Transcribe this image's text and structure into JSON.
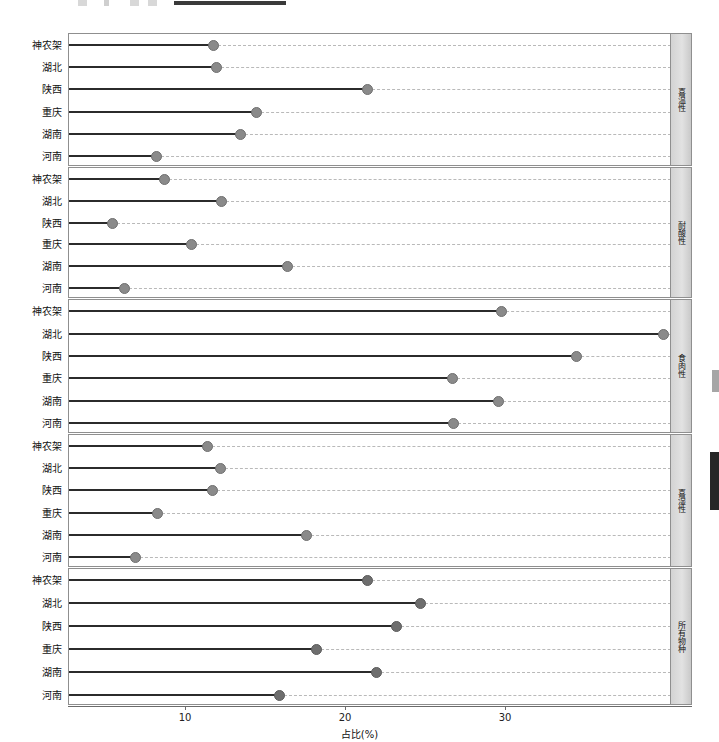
{
  "chart": {
    "type": "faceted-lollipop",
    "x_axis": {
      "title": "占比(%)",
      "ticks": [
        10,
        20,
        30
      ],
      "min": 4.0,
      "max": 43.0
    },
    "categories": [
      "神农架",
      "湖北",
      "陕西",
      "重庆",
      "湖南",
      "河南"
    ],
    "panels": [
      {
        "label": "喜温性",
        "values": [
          11.7,
          11.9,
          21.3,
          14.4,
          13.4,
          8.1
        ]
      },
      {
        "label": "耐酸性",
        "values": [
          8.6,
          12.2,
          5.4,
          10.3,
          16.3,
          6.1
        ]
      },
      {
        "label": "食肉性",
        "values": [
          29.7,
          39.8,
          34.4,
          26.6,
          29.5,
          26.7
        ]
      },
      {
        "label": "喜湿性",
        "values": [
          11.3,
          12.1,
          11.6,
          8.2,
          17.5,
          6.8
        ]
      },
      {
        "label": "所有物种",
        "values": [
          21.3,
          24.6,
          23.1,
          18.1,
          21.9,
          15.8
        ]
      }
    ]
  },
  "chart_data": {
    "type": "scatter",
    "title": "",
    "subtitle": "",
    "xlabel": "占比(%)",
    "ylabel": "",
    "xlim": [
      4.0,
      43.0
    ],
    "xticks": [
      10,
      20,
      30
    ],
    "grid": "horizontal-dashed",
    "legend": "none",
    "facet_labels": [
      "喜温性",
      "耐酸性",
      "食肉性",
      "喜湿性",
      "所有物种"
    ],
    "categories": [
      "神农架",
      "湖北",
      "陕西",
      "重庆",
      "湖南",
      "河南"
    ],
    "series": [
      {
        "name": "喜温性",
        "values": [
          11.7,
          11.9,
          21.3,
          14.4,
          13.4,
          8.1
        ]
      },
      {
        "name": "耐酸性",
        "values": [
          8.6,
          12.2,
          5.4,
          10.3,
          16.3,
          6.1
        ]
      },
      {
        "name": "食肉性",
        "values": [
          29.7,
          39.8,
          34.4,
          26.6,
          29.5,
          26.7
        ]
      },
      {
        "name": "喜湿性",
        "values": [
          11.3,
          12.1,
          11.6,
          8.2,
          17.5,
          6.8
        ]
      },
      {
        "name": "所有物种",
        "values": [
          21.3,
          24.6,
          23.1,
          18.1,
          21.9,
          15.8
        ]
      }
    ],
    "marker": {
      "shape": "circle",
      "color": "#8a8a8a",
      "edge_color": "#6f6f6f"
    },
    "stem": {
      "color": "#2b2b2b",
      "width": 2
    }
  },
  "axis_tick_labels": {
    "t10": "10",
    "t20": "20",
    "t30": "30"
  }
}
